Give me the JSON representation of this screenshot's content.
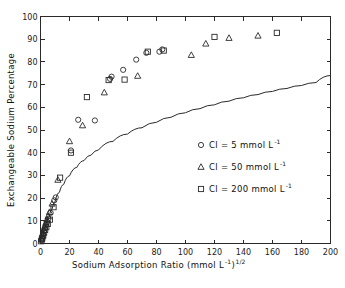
{
  "chart_data": {
    "type": "scatter",
    "title": "",
    "xlabel": "Sodium Adsorption Ratio (mmol L-1)1/2",
    "xlabel_main": "Sodium Adsorption Ratio (mmol L",
    "xlabel_sup1": "-1",
    "xlabel_mid": ")",
    "xlabel_sup2": "1/2",
    "ylabel": "Exchangeable Sodium Percentage",
    "xlim": [
      0,
      200
    ],
    "ylim": [
      0,
      100
    ],
    "xticks": [
      0,
      20,
      40,
      60,
      80,
      100,
      120,
      140,
      160,
      180,
      200
    ],
    "yticks": [
      0,
      10,
      20,
      30,
      40,
      50,
      60,
      70,
      80,
      90,
      100
    ],
    "grid": false,
    "legend_position": "center-right",
    "series": [
      {
        "name": "Cl = 5 mmol L-1",
        "label_main": "Cl = 5 mmol L",
        "label_sup": "-1",
        "marker": "circle",
        "points": [
          [
            0.6,
            1.5
          ],
          [
            1.0,
            2.2
          ],
          [
            1.4,
            3.0
          ],
          [
            1.8,
            4.2
          ],
          [
            2.4,
            5.5
          ],
          [
            3.0,
            6.8
          ],
          [
            3.8,
            8.2
          ],
          [
            4.6,
            9.5
          ],
          [
            5.5,
            11.0
          ],
          [
            7.0,
            13.5
          ],
          [
            9.5,
            19.0
          ],
          [
            10.5,
            20.3
          ],
          [
            21.0,
            41.0
          ],
          [
            26.0,
            54.5
          ],
          [
            37.5,
            54.2
          ],
          [
            48.0,
            72.5
          ],
          [
            49.0,
            73.5
          ],
          [
            57.0,
            76.5
          ],
          [
            66.0,
            81.0
          ],
          [
            73.0,
            84.0
          ],
          [
            82.0,
            84.5
          ],
          [
            84.0,
            85.5
          ]
        ]
      },
      {
        "name": "Cl = 50 mmol L-1",
        "label_main": "Cl = 50 mmol L",
        "label_sup": "-1",
        "marker": "triangle",
        "points": [
          [
            0.8,
            2.0
          ],
          [
            1.2,
            3.2
          ],
          [
            1.7,
            4.5
          ],
          [
            2.2,
            6.0
          ],
          [
            2.9,
            7.5
          ],
          [
            3.6,
            9.0
          ],
          [
            4.4,
            10.5
          ],
          [
            5.2,
            12.0
          ],
          [
            6.2,
            13.8
          ],
          [
            8.0,
            17.5
          ],
          [
            12.0,
            28.0
          ],
          [
            20.0,
            45.0
          ],
          [
            29.0,
            52.0
          ],
          [
            44.0,
            66.5
          ],
          [
            67.0,
            73.8
          ],
          [
            104.0,
            83.0
          ],
          [
            114.0,
            88.0
          ],
          [
            130.0,
            90.5
          ],
          [
            150.0,
            91.5
          ]
        ]
      },
      {
        "name": "Cl = 200 mmol L-1",
        "label_main": "Cl = 200 mmol L",
        "label_sup": "-1",
        "marker": "square",
        "points": [
          [
            0.5,
            1.0
          ],
          [
            0.9,
            1.8
          ],
          [
            1.3,
            2.6
          ],
          [
            1.9,
            3.6
          ],
          [
            2.5,
            4.8
          ],
          [
            3.2,
            6.0
          ],
          [
            4.0,
            7.2
          ],
          [
            5.0,
            8.6
          ],
          [
            6.5,
            10.5
          ],
          [
            9.0,
            16.0
          ],
          [
            13.5,
            29.0
          ],
          [
            21.0,
            40.0
          ],
          [
            32.0,
            64.5
          ],
          [
            47.0,
            72.0
          ],
          [
            58.0,
            72.2
          ],
          [
            74.0,
            84.5
          ],
          [
            85.0,
            85.0
          ],
          [
            120.0,
            91.0
          ],
          [
            163.0,
            92.8
          ]
        ]
      }
    ],
    "curve": {
      "name": "theoretical ESP-SAR relationship",
      "style": "solid-line",
      "points": [
        [
          0,
          0
        ],
        [
          2,
          4.0
        ],
        [
          4,
          8.0
        ],
        [
          6,
          11.8
        ],
        [
          8,
          15.2
        ],
        [
          10,
          18.3
        ],
        [
          13,
          22.5
        ],
        [
          16,
          26.0
        ],
        [
          20,
          29.8
        ],
        [
          25,
          33.5
        ],
        [
          30,
          36.5
        ],
        [
          35,
          39.0
        ],
        [
          40,
          41.2
        ],
        [
          50,
          45.0
        ],
        [
          60,
          48.2
        ],
        [
          70,
          51.0
        ],
        [
          80,
          53.4
        ],
        [
          90,
          55.6
        ],
        [
          100,
          57.6
        ],
        [
          110,
          59.4
        ],
        [
          120,
          61.1
        ],
        [
          130,
          62.7
        ],
        [
          140,
          64.2
        ],
        [
          150,
          65.6
        ],
        [
          160,
          67.0
        ],
        [
          170,
          68.3
        ],
        [
          180,
          69.6
        ],
        [
          190,
          70.9
        ],
        [
          200,
          74.0
        ]
      ]
    }
  },
  "legend": {
    "items": [
      {
        "marker": "circle",
        "text_main": "Cl = 5 mmol L",
        "sup": "-1"
      },
      {
        "marker": "triangle",
        "text_main": "Cl = 50 mmol L",
        "sup": "-1"
      },
      {
        "marker": "square",
        "text_main": "Cl = 200 mmol L",
        "sup": "-1"
      }
    ]
  },
  "colors": {
    "background": "#ffffff",
    "axis": "#2a2a2a",
    "marker": "#2a2a2a",
    "curve": "#2a2a2a",
    "text": "#111111"
  }
}
